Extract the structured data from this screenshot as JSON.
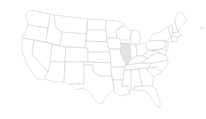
{
  "map": {
    "type": "US states choropleth",
    "highlighted_state": "Illinois",
    "colors": {
      "background": "#ffffff",
      "state_fill": "#ffffff",
      "state_stroke": "#c8c8c8",
      "highlight_fill": "#e3e3e3"
    }
  }
}
